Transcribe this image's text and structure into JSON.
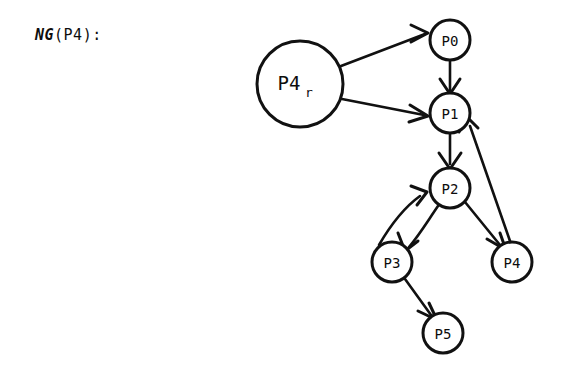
{
  "caption": {
    "function_name": "NG",
    "argument": "(P4):",
    "full_text": "NG(P4):"
  },
  "graph": {
    "stroke_color": "#111111",
    "fill_color": "#ffffff",
    "background_color": "#ffffff",
    "root": {
      "id": "P4r",
      "base_label": "P4",
      "subscript": "r",
      "cx": 300,
      "cy": 84,
      "r": 43
    },
    "nodes": [
      {
        "id": "P0",
        "label": "P0",
        "cx": 450,
        "cy": 40,
        "r": 20
      },
      {
        "id": "P1",
        "label": "P1",
        "cx": 450,
        "cy": 113,
        "r": 20
      },
      {
        "id": "P2",
        "label": "P2",
        "cx": 450,
        "cy": 188,
        "r": 20
      },
      {
        "id": "P3",
        "label": "P3",
        "cx": 392,
        "cy": 262,
        "r": 20
      },
      {
        "id": "P4",
        "label": "P4",
        "cx": 512,
        "cy": 262,
        "r": 20
      },
      {
        "id": "P5",
        "label": "P5",
        "cx": 443,
        "cy": 333,
        "r": 20
      }
    ],
    "edges": [
      {
        "id": "e-p4r-p0",
        "from": "P4r",
        "to": "P0",
        "kind": "straight"
      },
      {
        "id": "e-p4r-p1",
        "from": "P4r",
        "to": "P1",
        "kind": "straight"
      },
      {
        "id": "e-p0-p1",
        "from": "P0",
        "to": "P1",
        "kind": "straight"
      },
      {
        "id": "e-p1-p2",
        "from": "P1",
        "to": "P2",
        "kind": "straight"
      },
      {
        "id": "e-p2-p3",
        "from": "P2",
        "to": "P3",
        "kind": "curved"
      },
      {
        "id": "e-p3-p2",
        "from": "P3",
        "to": "P2",
        "kind": "curved"
      },
      {
        "id": "e-p2-p4",
        "from": "P2",
        "to": "P4",
        "kind": "straight"
      },
      {
        "id": "e-p4-p1",
        "from": "P4",
        "to": "P1",
        "kind": "straight"
      },
      {
        "id": "e-p3-p5",
        "from": "P3",
        "to": "P5",
        "kind": "straight"
      }
    ]
  }
}
